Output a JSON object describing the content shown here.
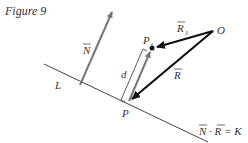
{
  "caption": "Figure 9",
  "labels": {
    "normal": "N",
    "line": "L",
    "origin": "O",
    "p1": "P",
    "p1_sub": "1",
    "p": "P",
    "r1": "R",
    "r1_sub": "1",
    "r": "R",
    "distance": "d",
    "equation": "N · R = K"
  },
  "colors": {
    "dark": "#111111",
    "gray": "#777777",
    "line": "#444444"
  }
}
